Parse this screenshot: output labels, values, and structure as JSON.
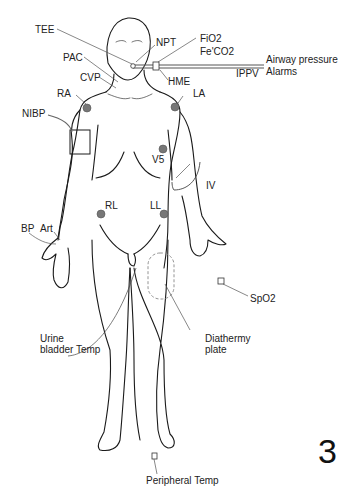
{
  "figure": {
    "number": "3",
    "colors": {
      "outline": "#1a1a1a",
      "leader": "#555555",
      "electrode": "#777777",
      "dashed": "#888888"
    },
    "labels": {
      "tee": "TEE",
      "npt": "NPT",
      "fio2": "FiO2",
      "feco2": "Fe'CO2",
      "airway_pressure": "Airway pressure",
      "alarms": "Alarms",
      "ippv": "IPPV",
      "pac": "PAC",
      "cvp": "CVP",
      "hme": "HME",
      "ra": "RA",
      "la": "LA",
      "nibp": "NIBP",
      "v5": "V5",
      "iv": "IV",
      "rl": "RL",
      "ll": "LL",
      "bp": "BP",
      "art": "Art",
      "spo2": "SpO2",
      "urine_temp": "Urine\nbladder Temp",
      "diathermy": "Diathermy\nplate",
      "peripheral_temp": "Peripheral Temp"
    },
    "electrodes": [
      {
        "name": "RA",
        "x": 87,
        "y": 108
      },
      {
        "name": "LA",
        "x": 175,
        "y": 107
      },
      {
        "name": "V5",
        "x": 163,
        "y": 149
      },
      {
        "name": "RL",
        "x": 101,
        "y": 214
      },
      {
        "name": "LL",
        "x": 164,
        "y": 214
      }
    ]
  }
}
